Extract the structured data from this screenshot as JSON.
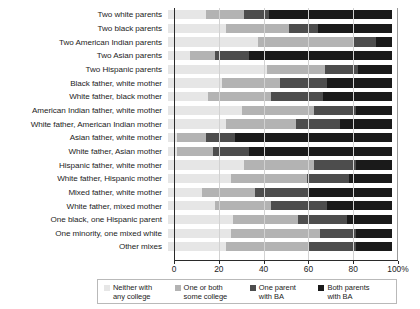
{
  "chart_data": {
    "type": "bar",
    "subtype": "stacked-horizontal-100-percent",
    "title": "",
    "xlabel": "",
    "ylabel": "",
    "xlim": [
      0,
      100
    ],
    "grid": true,
    "legend_position": "bottom",
    "xticks": [
      0,
      20,
      40,
      60,
      80,
      100
    ],
    "xtick_labels": [
      "0",
      "20",
      "40",
      "60",
      "80",
      "100%"
    ],
    "categories": [
      "Two white parents",
      "Two black parents",
      "Two American Indian parents",
      "Two Asian parents",
      "Two Hispanic parents",
      "Black father, white mother",
      "White father, black mother",
      "American Indian father, white mother",
      "White father, American Indian mother",
      "Asian father, white mother",
      "White father, Asian mother",
      "Hispanic father, white mother",
      "White father, Hispanic mother",
      "Mixed father, white mother",
      "White father, mixed mother",
      "One black, one Hispanic parent",
      "One minority, one mixed white",
      "Other mixes"
    ],
    "series": [
      {
        "name": "Neither with any college",
        "color": "#e6e6e6",
        "values": [
          17,
          26,
          40,
          10,
          44,
          24,
          18,
          33,
          26,
          4,
          4,
          34,
          28,
          15,
          21,
          29,
          28,
          26
        ]
      },
      {
        "name": "One or both some college",
        "color": "#b3b3b3",
        "values": [
          17,
          28,
          43,
          11,
          26,
          26,
          28,
          32,
          31,
          13,
          16,
          31,
          34,
          24,
          25,
          29,
          40,
          37
        ]
      },
      {
        "name": "One parent with BA",
        "color": "#4d4d4d",
        "values": [
          11,
          13,
          10,
          15,
          15,
          21,
          23,
          19,
          20,
          13,
          16,
          19,
          19,
          24,
          25,
          22,
          16,
          21
        ]
      },
      {
        "name": "Both parents with BA",
        "color": "#1a1a1a",
        "values": [
          55,
          33,
          7,
          64,
          15,
          29,
          31,
          16,
          23,
          70,
          64,
          16,
          19,
          37,
          29,
          20,
          16,
          16
        ]
      }
    ]
  },
  "legend": {
    "items": [
      {
        "label": "Neither with\nany college",
        "color": "#e6e6e6"
      },
      {
        "label": "One or both\nsome college",
        "color": "#b3b3b3"
      },
      {
        "label": "One parent\nwith BA",
        "color": "#4d4d4d"
      },
      {
        "label": "Both parents\nwith BA",
        "color": "#1a1a1a"
      }
    ]
  }
}
